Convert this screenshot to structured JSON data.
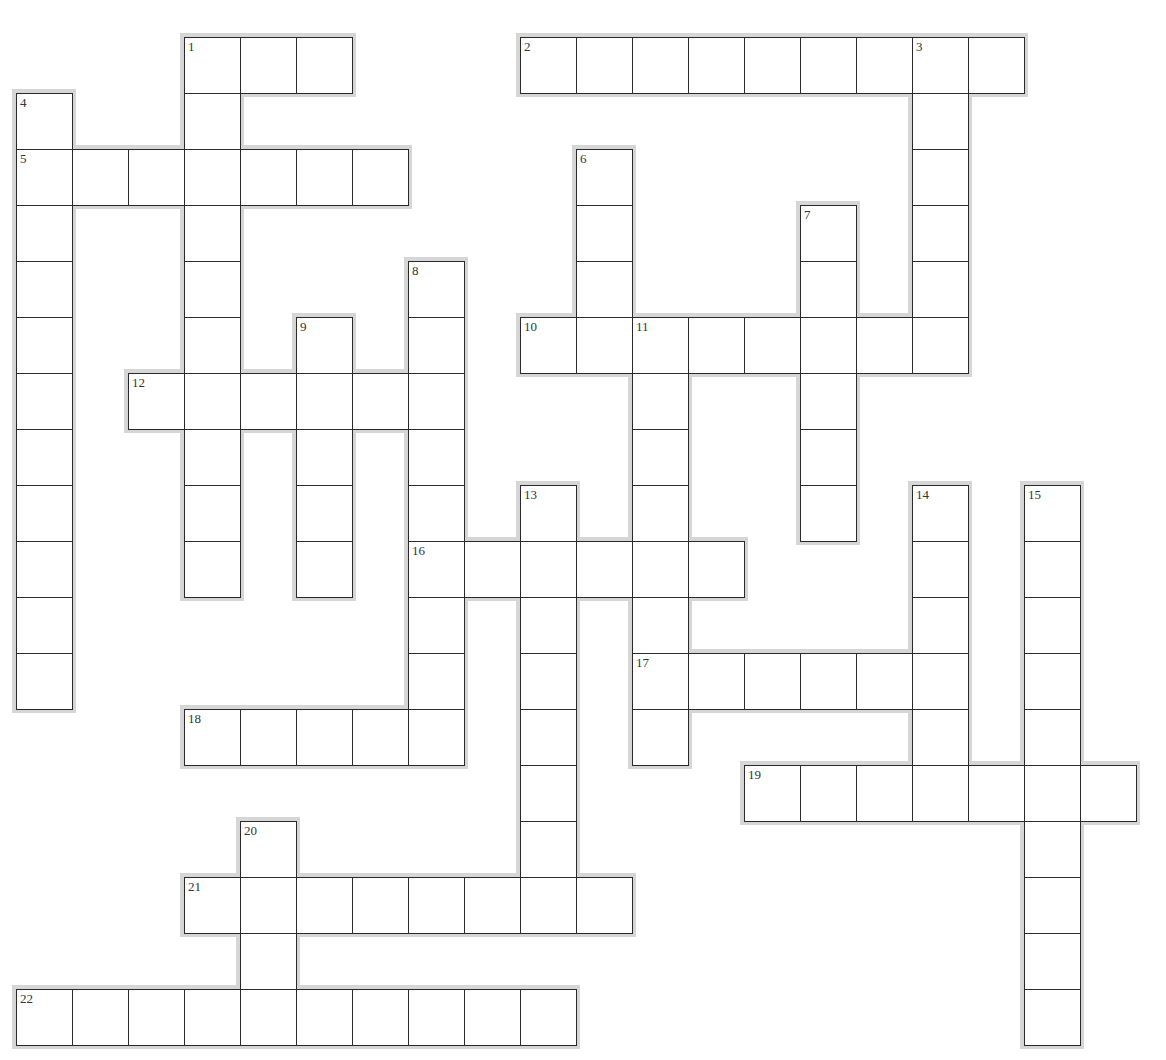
{
  "puzzle": {
    "grid": {
      "origin_x": 16,
      "origin_y": 37,
      "cell_size": 56
    },
    "colors": {
      "border": "#2a2a2a",
      "halo": "#d6d6d6",
      "cell_bg": "#ffffff",
      "number": "#333333"
    },
    "words": [
      {
        "number": "1",
        "direction": "across",
        "row": 0,
        "col": 3,
        "length": 3
      },
      {
        "number": "2",
        "direction": "across",
        "row": 0,
        "col": 9,
        "length": 9
      },
      {
        "number": "5",
        "direction": "across",
        "row": 2,
        "col": 0,
        "length": 7
      },
      {
        "number": "10",
        "direction": "across",
        "row": 5,
        "col": 9,
        "length": 8
      },
      {
        "number": "12",
        "direction": "across",
        "row": 6,
        "col": 2,
        "length": 6
      },
      {
        "number": "16",
        "direction": "across",
        "row": 9,
        "col": 7,
        "length": 6
      },
      {
        "number": "17",
        "direction": "across",
        "row": 11,
        "col": 11,
        "length": 6
      },
      {
        "number": "18",
        "direction": "across",
        "row": 12,
        "col": 3,
        "length": 5
      },
      {
        "number": "19",
        "direction": "across",
        "row": 13,
        "col": 13,
        "length": 7
      },
      {
        "number": "21",
        "direction": "across",
        "row": 15,
        "col": 3,
        "length": 8
      },
      {
        "number": "22",
        "direction": "across",
        "row": 17,
        "col": 0,
        "length": 10
      },
      {
        "number": "1",
        "direction": "down",
        "row": 0,
        "col": 3,
        "length": 10
      },
      {
        "number": "3",
        "direction": "down",
        "row": 0,
        "col": 16,
        "length": 6
      },
      {
        "number": "4",
        "direction": "down",
        "row": 1,
        "col": 0,
        "length": 11
      },
      {
        "number": "6",
        "direction": "down",
        "row": 2,
        "col": 10,
        "length": 4
      },
      {
        "number": "7",
        "direction": "down",
        "row": 3,
        "col": 14,
        "length": 6
      },
      {
        "number": "8",
        "direction": "down",
        "row": 4,
        "col": 7,
        "length": 9
      },
      {
        "number": "9",
        "direction": "down",
        "row": 5,
        "col": 5,
        "length": 5
      },
      {
        "number": "11",
        "direction": "down",
        "row": 5,
        "col": 11,
        "length": 8
      },
      {
        "number": "13",
        "direction": "down",
        "row": 8,
        "col": 9,
        "length": 7
      },
      {
        "number": "14",
        "direction": "down",
        "row": 8,
        "col": 16,
        "length": 6
      },
      {
        "number": "15",
        "direction": "down",
        "row": 8,
        "col": 18,
        "length": 10
      },
      {
        "number": "20",
        "direction": "down",
        "row": 14,
        "col": 4,
        "length": 3
      }
    ]
  }
}
